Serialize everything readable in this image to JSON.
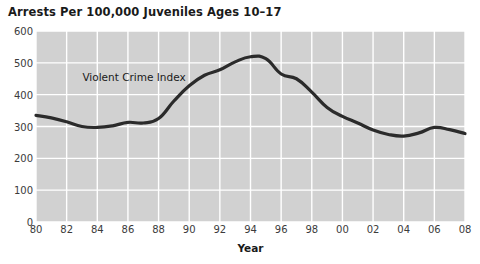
{
  "chart_data": {
    "type": "line",
    "title": "Arrests Per 100,000 Juveniles Ages 10–17",
    "xlabel": "Year",
    "ylabel": "",
    "grid": true,
    "grid_color": "#ffffff",
    "plot_bg_color": "#d1d1d1",
    "line_color": "#2b2b2b",
    "legend": "none",
    "xlim": [
      1980,
      2008
    ],
    "ylim": [
      0,
      600
    ],
    "ytick_values": [
      0,
      100,
      200,
      300,
      400,
      500,
      600
    ],
    "ytick_labels": [
      "0",
      "100",
      "200",
      "300",
      "400",
      "500",
      "600"
    ],
    "xtick_values": [
      1980,
      1982,
      1984,
      1986,
      1988,
      1990,
      1992,
      1994,
      1996,
      1998,
      2000,
      2002,
      2004,
      2006,
      2008
    ],
    "xtick_labels": [
      "80",
      "82",
      "84",
      "86",
      "88",
      "90",
      "92",
      "94",
      "96",
      "98",
      "00",
      "02",
      "04",
      "06",
      "08"
    ],
    "annotations": [
      {
        "text": "Violent Crime Index",
        "x": 1986.4,
        "y": 455
      }
    ],
    "series": [
      {
        "name": "Violent Crime Index",
        "x": [
          1980,
          1981,
          1982,
          1983,
          1984,
          1985,
          1986,
          1987,
          1988,
          1989,
          1990,
          1991,
          1992,
          1993,
          1994,
          1995,
          1996,
          1997,
          1998,
          1999,
          2000,
          2001,
          2002,
          2003,
          2004,
          2005,
          2006,
          2007,
          2008
        ],
        "values": [
          335,
          327,
          315,
          300,
          297,
          302,
          313,
          311,
          325,
          380,
          428,
          461,
          478,
          503,
          519,
          513,
          465,
          450,
          408,
          360,
          332,
          311,
          289,
          275,
          270,
          280,
          297,
          290,
          278
        ]
      }
    ]
  }
}
